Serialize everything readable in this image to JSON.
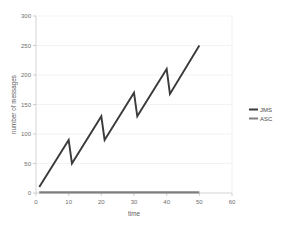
{
  "chart_data": {
    "type": "line",
    "title": "",
    "xlabel": "time",
    "ylabel": "number of messages",
    "xlim": [
      0,
      60
    ],
    "ylim": [
      0,
      300
    ],
    "xticks": [
      0,
      10,
      20,
      30,
      40,
      50,
      60
    ],
    "yticks": [
      0,
      50,
      100,
      150,
      200,
      250,
      300
    ],
    "grid": "horizontal",
    "legend_position": "right",
    "series": [
      {
        "name": "JMS",
        "color": "#3a3a3a",
        "x": [
          1,
          10,
          11,
          20,
          21,
          30,
          31,
          40,
          41,
          50
        ],
        "values": [
          10,
          90,
          50,
          130,
          90,
          170,
          130,
          210,
          168,
          250
        ]
      },
      {
        "name": "ASC",
        "color": "#7f7f7f",
        "x": [
          1,
          50
        ],
        "values": [
          1,
          1
        ]
      }
    ]
  },
  "axes": {
    "x_title": "time",
    "y_title": "number of messages",
    "x_tick_labels": [
      "0",
      "10",
      "20",
      "30",
      "40",
      "50",
      "60"
    ],
    "y_tick_labels": [
      "0",
      "50",
      "100",
      "150",
      "200",
      "250",
      "300"
    ]
  },
  "legend": {
    "items": [
      {
        "label": "JMS",
        "color": "#3a3a3a"
      },
      {
        "label": "ASC",
        "color": "#7f7f7f"
      }
    ]
  },
  "colors": {
    "background": "#ffffff",
    "gridline": "#eeeeee",
    "axis": "#c9c9c9",
    "tick_text": "#6e6e6e",
    "title_text": "#5c5c5c",
    "series_jms": "#3a3a3a",
    "series_asc": "#7f7f7f"
  }
}
